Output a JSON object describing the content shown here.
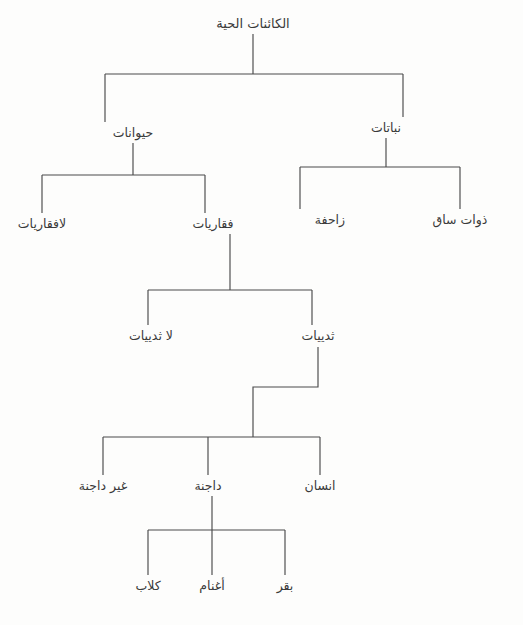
{
  "diagram": {
    "title": "الكائنات الحية",
    "type": "hierarchy-tree",
    "language": "ar",
    "direction": "rtl",
    "colors": {
      "background": "#fdfdfc",
      "line": "#4a4a4a",
      "text": "#3a3a3a"
    },
    "levels": [
      {
        "index": 0,
        "nodes": [
          {
            "id": "living",
            "label": "الكائنات الحية",
            "x": 253,
            "y": 28
          }
        ]
      },
      {
        "index": 1,
        "nodes": [
          {
            "id": "animals",
            "label": "حيوانات",
            "x": 133,
            "y": 137
          },
          {
            "id": "plants",
            "label": "نباتات",
            "x": 386,
            "y": 132
          }
        ]
      },
      {
        "index": 2,
        "nodes": [
          {
            "id": "invertebrates",
            "label": "لافقاريات",
            "x": 42,
            "y": 228
          },
          {
            "id": "vertebrates",
            "label": "فقاريات",
            "x": 213,
            "y": 228
          },
          {
            "id": "creeping",
            "label": "زاحفة",
            "x": 330,
            "y": 224
          },
          {
            "id": "stemmed",
            "label": "ذوات ساق",
            "x": 460,
            "y": 224
          }
        ]
      },
      {
        "index": 3,
        "nodes": [
          {
            "id": "non-mammals",
            "label": "لا ثدييات",
            "x": 151,
            "y": 340
          },
          {
            "id": "mammals",
            "label": "ثدييات",
            "x": 318,
            "y": 340
          }
        ]
      },
      {
        "index": 4,
        "nodes": [
          {
            "id": "non-domestic",
            "label": "غير داجنة",
            "x": 103,
            "y": 490
          },
          {
            "id": "domestic",
            "label": "داجنة",
            "x": 208,
            "y": 490
          },
          {
            "id": "human",
            "label": "انسان",
            "x": 320,
            "y": 490
          }
        ]
      },
      {
        "index": 5,
        "nodes": [
          {
            "id": "dogs",
            "label": "كلاب",
            "x": 148,
            "y": 590
          },
          {
            "id": "sheep",
            "label": "أغنام",
            "x": 212,
            "y": 590
          },
          {
            "id": "cattle",
            "label": "بقر",
            "x": 285,
            "y": 590
          }
        ]
      }
    ],
    "connectors": [
      {
        "id": "root-stem",
        "from": "living",
        "path": "M 253 34 L 253 74"
      },
      {
        "id": "root-bar",
        "from": "living",
        "path": "M 105 74 L 403 74"
      },
      {
        "id": "root-to-animals",
        "from": "living",
        "to": "animals",
        "path": "M 105 74 L 105 122"
      },
      {
        "id": "root-to-plants",
        "from": "living",
        "to": "plants",
        "path": "M 403 74 L 403 117"
      },
      {
        "id": "animals-stem",
        "from": "animals",
        "path": "M 133 143 L 133 175"
      },
      {
        "id": "animals-bar",
        "from": "animals",
        "path": "M 42 175 L 205 175"
      },
      {
        "id": "animals-to-invertebrates",
        "from": "animals",
        "to": "invertebrates",
        "path": "M 42 175 L 42 213"
      },
      {
        "id": "animals-to-vertebrates",
        "from": "animals",
        "to": "vertebrates",
        "path": "M 205 175 L 205 213"
      },
      {
        "id": "plants-stem",
        "from": "plants",
        "path": "M 386 138 L 386 167"
      },
      {
        "id": "plants-bar",
        "from": "plants",
        "path": "M 300 167 L 460 167"
      },
      {
        "id": "plants-to-creeping",
        "from": "plants",
        "to": "creeping",
        "path": "M 300 167 L 300 209"
      },
      {
        "id": "plants-to-stemmed",
        "from": "plants",
        "to": "stemmed",
        "path": "M 460 167 L 460 209"
      },
      {
        "id": "vertebrates-stem",
        "from": "vertebrates",
        "path": "M 230 234 L 230 290"
      },
      {
        "id": "vertebrates-bar",
        "from": "vertebrates",
        "path": "M 148 290 L 312 290"
      },
      {
        "id": "vertebrates-to-nonmammals",
        "from": "vertebrates",
        "to": "non-mammals",
        "path": "M 148 290 L 148 325"
      },
      {
        "id": "vertebrates-to-mammals",
        "from": "vertebrates",
        "to": "mammals",
        "path": "M 312 290 L 312 325"
      },
      {
        "id": "mammals-jog",
        "from": "mammals",
        "path": "M 318 347 L 318 387 L 253 387 L 253 437"
      },
      {
        "id": "mammals-bar",
        "from": "mammals",
        "path": "M 103 437 L 320 437"
      },
      {
        "id": "mammals-to-nondomestic",
        "from": "mammals",
        "to": "non-domestic",
        "path": "M 103 437 L 103 475"
      },
      {
        "id": "mammals-to-domestic",
        "from": "mammals",
        "to": "domestic",
        "path": "M 208 437 L 208 475"
      },
      {
        "id": "mammals-to-human",
        "from": "mammals",
        "to": "human",
        "path": "M 320 437 L 320 475"
      },
      {
        "id": "domestic-stem",
        "from": "domestic",
        "path": "M 212 496 L 212 530"
      },
      {
        "id": "domestic-bar",
        "from": "domestic",
        "path": "M 148 530 L 285 530"
      },
      {
        "id": "domestic-to-dogs",
        "from": "domestic",
        "to": "dogs",
        "path": "M 148 530 L 148 575"
      },
      {
        "id": "domestic-to-sheep",
        "from": "domestic",
        "to": "sheep",
        "path": "M 212 530 L 212 575"
      },
      {
        "id": "domestic-to-cattle",
        "from": "domestic",
        "to": "cattle",
        "path": "M 285 530 L 285 575"
      }
    ]
  }
}
